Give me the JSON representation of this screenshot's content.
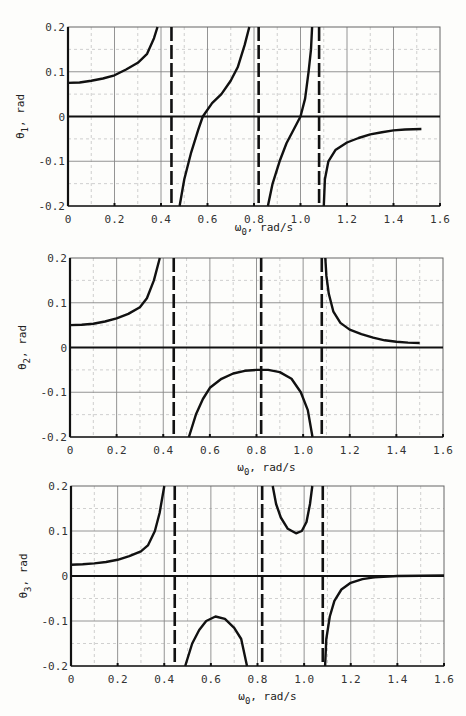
{
  "chart_data": [
    {
      "type": "line",
      "title": "",
      "xlabel": "ω0, rad/s",
      "ylabel": "θ1, rad",
      "xlim": [
        0,
        1.6
      ],
      "ylim": [
        -0.2,
        0.2
      ],
      "grid": true,
      "x_ticks": [
        "0",
        "0.2",
        "0.4",
        "0.6",
        "0.8",
        "1.0",
        "1.2",
        "1.4",
        "1.6"
      ],
      "y_ticks": [
        "0.2",
        "0.1",
        "0",
        "-0.1",
        "-0.2"
      ],
      "asymptotes": [
        0.445,
        0.82,
        1.08
      ],
      "series": [
        {
          "name": "branch-1",
          "points": [
            [
              0,
              0.075
            ],
            [
              0.05,
              0.076
            ],
            [
              0.1,
              0.08
            ],
            [
              0.15,
              0.085
            ],
            [
              0.2,
              0.092
            ],
            [
              0.25,
              0.105
            ],
            [
              0.3,
              0.12
            ],
            [
              0.34,
              0.14
            ],
            [
              0.37,
              0.175
            ],
            [
              0.385,
              0.2
            ]
          ]
        },
        {
          "name": "branch-2",
          "points": [
            [
              0.48,
              -0.2
            ],
            [
              0.5,
              -0.14
            ],
            [
              0.53,
              -0.08
            ],
            [
              0.56,
              -0.03
            ],
            [
              0.58,
              0
            ],
            [
              0.62,
              0.03
            ],
            [
              0.66,
              0.05
            ],
            [
              0.7,
              0.08
            ],
            [
              0.73,
              0.11
            ],
            [
              0.76,
              0.16
            ],
            [
              0.78,
              0.2
            ]
          ]
        },
        {
          "name": "branch-3",
          "points": [
            [
              0.86,
              -0.2
            ],
            [
              0.88,
              -0.15
            ],
            [
              0.91,
              -0.1
            ],
            [
              0.94,
              -0.06
            ],
            [
              0.98,
              -0.02
            ],
            [
              1.0,
              0
            ],
            [
              1.02,
              0.04
            ],
            [
              1.035,
              0.1
            ],
            [
              1.045,
              0.15
            ],
            [
              1.05,
              0.2
            ]
          ]
        },
        {
          "name": "branch-4",
          "points": [
            [
              1.1,
              -0.2
            ],
            [
              1.105,
              -0.14
            ],
            [
              1.12,
              -0.1
            ],
            [
              1.15,
              -0.075
            ],
            [
              1.2,
              -0.058
            ],
            [
              1.25,
              -0.048
            ],
            [
              1.3,
              -0.04
            ],
            [
              1.35,
              -0.035
            ],
            [
              1.4,
              -0.031
            ],
            [
              1.45,
              -0.029
            ],
            [
              1.52,
              -0.028
            ]
          ]
        }
      ]
    },
    {
      "type": "line",
      "title": "",
      "xlabel": "ω0, rad/s",
      "ylabel": "θ2, rad",
      "xlim": [
        0,
        1.6
      ],
      "ylim": [
        -0.2,
        0.2
      ],
      "grid": true,
      "x_ticks": [
        "0",
        "0.2",
        "0.4",
        "0.6",
        "0.8",
        "1.0",
        "1.2",
        "1.4",
        "1.6"
      ],
      "y_ticks": [
        "0.2",
        "0.1",
        "0",
        "-0.1",
        "-0.2"
      ],
      "asymptotes": [
        0.445,
        0.82,
        1.08
      ],
      "series": [
        {
          "name": "branch-1",
          "points": [
            [
              0,
              0.05
            ],
            [
              0.05,
              0.051
            ],
            [
              0.1,
              0.053
            ],
            [
              0.15,
              0.058
            ],
            [
              0.2,
              0.065
            ],
            [
              0.25,
              0.075
            ],
            [
              0.3,
              0.09
            ],
            [
              0.33,
              0.11
            ],
            [
              0.36,
              0.15
            ],
            [
              0.385,
              0.2
            ]
          ]
        },
        {
          "name": "branch-2",
          "points": [
            [
              0.51,
              -0.2
            ],
            [
              0.54,
              -0.15
            ],
            [
              0.57,
              -0.115
            ],
            [
              0.6,
              -0.09
            ],
            [
              0.65,
              -0.07
            ],
            [
              0.7,
              -0.058
            ],
            [
              0.75,
              -0.052
            ],
            [
              0.8,
              -0.05
            ],
            [
              0.85,
              -0.05
            ],
            [
              0.9,
              -0.055
            ],
            [
              0.95,
              -0.07
            ],
            [
              0.99,
              -0.1
            ],
            [
              1.02,
              -0.14
            ],
            [
              1.04,
              -0.2
            ]
          ]
        },
        {
          "name": "branch-3",
          "points": [
            [
              1.095,
              0.2
            ],
            [
              1.1,
              0.16
            ],
            [
              1.11,
              0.12
            ],
            [
              1.13,
              0.08
            ],
            [
              1.16,
              0.055
            ],
            [
              1.2,
              0.04
            ],
            [
              1.25,
              0.03
            ],
            [
              1.3,
              0.022
            ],
            [
              1.35,
              0.016
            ],
            [
              1.4,
              0.013
            ],
            [
              1.45,
              0.011
            ],
            [
              1.5,
              0.01
            ]
          ]
        }
      ]
    },
    {
      "type": "line",
      "title": "",
      "xlabel": "ω0, rad/s",
      "ylabel": "θ3, rad",
      "xlim": [
        0,
        1.6
      ],
      "ylim": [
        -0.2,
        0.2
      ],
      "grid": true,
      "x_ticks": [
        "0",
        "0.2",
        "0.4",
        "0.6",
        "0.8",
        "1.0",
        "1.2",
        "1.4",
        "1.6"
      ],
      "y_ticks": [
        "0.2",
        "0.1",
        "0",
        "-0.1",
        "-0.2"
      ],
      "asymptotes": [
        0.445,
        0.82,
        1.08
      ],
      "series": [
        {
          "name": "branch-1",
          "points": [
            [
              0,
              0.025
            ],
            [
              0.05,
              0.026
            ],
            [
              0.1,
              0.028
            ],
            [
              0.15,
              0.031
            ],
            [
              0.2,
              0.036
            ],
            [
              0.25,
              0.044
            ],
            [
              0.3,
              0.055
            ],
            [
              0.33,
              0.068
            ],
            [
              0.36,
              0.1
            ],
            [
              0.38,
              0.14
            ],
            [
              0.4,
              0.2
            ]
          ]
        },
        {
          "name": "branch-2",
          "points": [
            [
              0.49,
              -0.2
            ],
            [
              0.52,
              -0.15
            ],
            [
              0.55,
              -0.12
            ],
            [
              0.58,
              -0.1
            ],
            [
              0.62,
              -0.09
            ],
            [
              0.66,
              -0.095
            ],
            [
              0.7,
              -0.115
            ],
            [
              0.73,
              -0.14
            ],
            [
              0.755,
              -0.2
            ]
          ]
        },
        {
          "name": "branch-3",
          "points": [
            [
              0.865,
              0.2
            ],
            [
              0.88,
              0.16
            ],
            [
              0.9,
              0.13
            ],
            [
              0.93,
              0.105
            ],
            [
              0.965,
              0.095
            ],
            [
              0.99,
              0.1
            ],
            [
              1.01,
              0.12
            ],
            [
              1.025,
              0.16
            ],
            [
              1.035,
              0.2
            ]
          ]
        },
        {
          "name": "branch-4",
          "points": [
            [
              1.09,
              -0.2
            ],
            [
              1.095,
              -0.14
            ],
            [
              1.11,
              -0.09
            ],
            [
              1.13,
              -0.055
            ],
            [
              1.16,
              -0.03
            ],
            [
              1.2,
              -0.015
            ],
            [
              1.25,
              -0.007
            ],
            [
              1.3,
              -0.003
            ],
            [
              1.4,
              0.0
            ],
            [
              1.6,
              0.001
            ]
          ]
        }
      ]
    }
  ]
}
